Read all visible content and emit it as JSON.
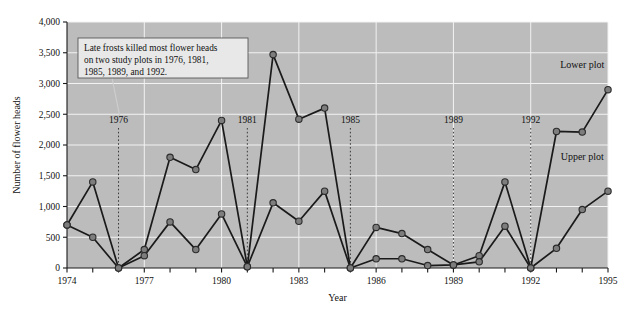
{
  "chart_data": {
    "type": "line",
    "title": "",
    "xlabel": "Year",
    "ylabel": "Number of flower heads",
    "xlim": [
      1974,
      1995
    ],
    "ylim": [
      0,
      4000
    ],
    "grid": true,
    "legend_position": "inline-right",
    "x": [
      1974,
      1975,
      1976,
      1977,
      1978,
      1979,
      1980,
      1981,
      1982,
      1983,
      1984,
      1985,
      1986,
      1987,
      1988,
      1989,
      1990,
      1991,
      1992,
      1993,
      1994,
      1995
    ],
    "x_tick_labels": [
      "1974",
      "1977",
      "1980",
      "1983",
      "1986",
      "1989",
      "1992",
      "1995"
    ],
    "x_ticks": [
      1974,
      1977,
      1980,
      1983,
      1986,
      1989,
      1992,
      1995
    ],
    "y_ticks": [
      0,
      500,
      1000,
      1500,
      2000,
      2500,
      3000,
      3500,
      4000
    ],
    "y_tick_labels": [
      "0",
      "500",
      "1,000",
      "1,500",
      "2,000",
      "2,500",
      "3,000",
      "3,500",
      "4,000"
    ],
    "series": [
      {
        "name": "Lower plot",
        "label_x": 1994,
        "label_y": 3250,
        "values": [
          700,
          1400,
          0,
          300,
          1800,
          1600,
          2400,
          20,
          3470,
          2420,
          2600,
          0,
          660,
          560,
          300,
          50,
          200,
          1400,
          0,
          2220,
          2210,
          2900
        ]
      },
      {
        "name": "Upper plot",
        "label_x": 1994,
        "label_y": 1750,
        "values": [
          700,
          500,
          0,
          200,
          750,
          300,
          880,
          20,
          1060,
          760,
          1250,
          0,
          150,
          150,
          40,
          50,
          100,
          680,
          0,
          320,
          950,
          1250
        ]
      }
    ],
    "event_markers": [
      {
        "year": 1976,
        "label": "1976"
      },
      {
        "year": 1981,
        "label": "1981"
      },
      {
        "year": 1985,
        "label": "1985"
      },
      {
        "year": 1989,
        "label": "1989"
      },
      {
        "year": 1992,
        "label": "1992"
      }
    ],
    "annotation": {
      "lines": [
        "Late frosts killed most flower heads",
        "on two study plots in 1976, 1981,",
        "1985, 1989, and 1992."
      ],
      "points_to_year": 1976
    },
    "colors": {
      "plot_background": "#bcbcbc",
      "gridline": "#f2f2f2",
      "line": "#1a1a1a",
      "marker_fill": "#7d7d7d",
      "marker_stroke": "#2b2b2b",
      "annotation_box": "#e8e8e8",
      "page_background": "#ffffff"
    }
  }
}
